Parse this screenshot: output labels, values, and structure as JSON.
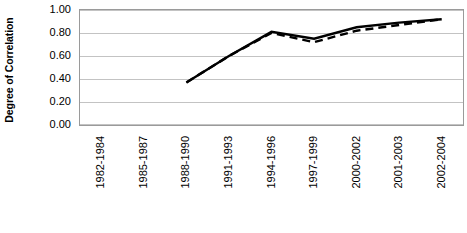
{
  "chart_data": {
    "type": "line",
    "title": "",
    "xlabel": "",
    "ylabel": "Degree of Correlation",
    "ylim": [
      0.0,
      1.0
    ],
    "ytick_labels": [
      "1.00",
      "0.80",
      "0.60",
      "0.40",
      "0.20",
      "0.00"
    ],
    "ytick_values": [
      1.0,
      0.8,
      0.6,
      0.4,
      0.2,
      0.0
    ],
    "grid": true,
    "legend": "none",
    "categories": [
      "1982-1984",
      "1985-1987",
      "1988-1990",
      "1991-1993",
      "1994-1996",
      "1997-1999",
      "2000-2002",
      "2001-2003",
      "2002-2004"
    ],
    "series": [
      {
        "name": "solid-series",
        "style": "solid",
        "color": "#000000",
        "values": [
          null,
          null,
          0.37,
          0.6,
          0.81,
          0.75,
          0.85,
          0.89,
          0.92
        ]
      },
      {
        "name": "dashed-series",
        "style": "dashed",
        "color": "#000000",
        "values": [
          null,
          null,
          0.37,
          0.6,
          0.8,
          0.72,
          0.82,
          0.87,
          0.92
        ]
      }
    ]
  }
}
